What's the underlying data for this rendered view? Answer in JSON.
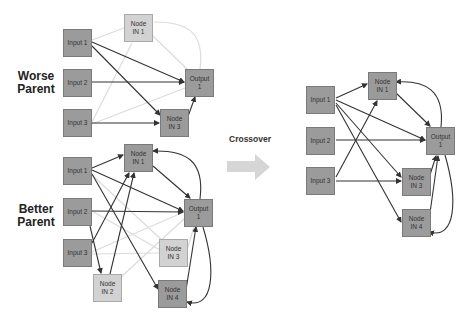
{
  "labels": {
    "worse": "Worse\nParent",
    "better": "Better\nParent",
    "crossover": "Crossover"
  },
  "worse_parent": {
    "nodes": [
      {
        "id": "in1",
        "text": "Input 1",
        "x": 63,
        "y": 29,
        "style": "dark"
      },
      {
        "id": "in2",
        "text": "Input 2",
        "x": 63,
        "y": 69,
        "style": "dark"
      },
      {
        "id": "in3",
        "text": "Input 3",
        "x": 63,
        "y": 109,
        "style": "dark"
      },
      {
        "id": "n1",
        "text": "Node\nIN 1",
        "x": 124,
        "y": 14,
        "style": "light"
      },
      {
        "id": "out",
        "text": "Output\n1",
        "x": 185,
        "y": 69,
        "style": "dark"
      },
      {
        "id": "n3",
        "text": "Node\nIN 3",
        "x": 160,
        "y": 109,
        "style": "dark"
      }
    ]
  },
  "better_parent": {
    "nodes": [
      {
        "id": "in1",
        "text": "Input 1",
        "x": 63,
        "y": 157,
        "style": "dark"
      },
      {
        "id": "in2",
        "text": "Input 2",
        "x": 63,
        "y": 198,
        "style": "dark"
      },
      {
        "id": "in3",
        "text": "Input 3",
        "x": 63,
        "y": 239,
        "style": "dark"
      },
      {
        "id": "n1",
        "text": "Node\nIN 1",
        "x": 124,
        "y": 144,
        "style": "dark"
      },
      {
        "id": "out",
        "text": "Output\n1",
        "x": 184,
        "y": 199,
        "style": "dark"
      },
      {
        "id": "n3",
        "text": "Node\nIN 3",
        "x": 159,
        "y": 239,
        "style": "light"
      },
      {
        "id": "n2",
        "text": "Node\nIN 2",
        "x": 93,
        "y": 274,
        "style": "light"
      },
      {
        "id": "n4",
        "text": "Node\nIN 4",
        "x": 158,
        "y": 280,
        "style": "dark"
      }
    ]
  },
  "child": {
    "nodes": [
      {
        "id": "in1",
        "text": "Input 1",
        "x": 306,
        "y": 86,
        "style": "dark"
      },
      {
        "id": "in2",
        "text": "Input 2",
        "x": 306,
        "y": 127,
        "style": "dark"
      },
      {
        "id": "in3",
        "text": "Input 3",
        "x": 306,
        "y": 167,
        "style": "dark"
      },
      {
        "id": "n1",
        "text": "Node\nIN 1",
        "x": 368,
        "y": 72,
        "style": "dark"
      },
      {
        "id": "out",
        "text": "Output\n1",
        "x": 426,
        "y": 127,
        "style": "dark"
      },
      {
        "id": "n3",
        "text": "Node\nIN 3",
        "x": 402,
        "y": 168,
        "style": "dark"
      },
      {
        "id": "n4",
        "text": "Node\nIN 4",
        "x": 402,
        "y": 209,
        "style": "dark"
      }
    ]
  },
  "colors": {
    "dark_node": "#9b9b9b",
    "light_node": "#d2d2d2",
    "active_edge": "#333333",
    "disabled_edge": "#dcdcdc",
    "arrow": "#d6d6d6"
  }
}
